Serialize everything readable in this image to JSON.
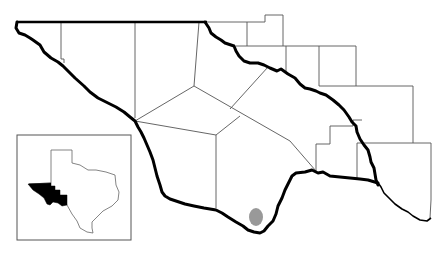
{
  "map": {
    "type": "regional-county-map",
    "description": "Regional map showing counties bounded by a thick river/boundary line, with an inset locator map of Texas and a gray oval marking a site",
    "colors": {
      "background": "#ffffff",
      "boundary_line": "#000000",
      "county_line": "#555555",
      "inset_highlight": "#000000",
      "site_marker": "#999999"
    },
    "inset": {
      "label": "Texas locator inset",
      "highlighted_region": "West Texas (Trans-Pecos)"
    },
    "site_marker": {
      "shape": "oval",
      "cx": 256,
      "cy": 217,
      "rx": 7,
      "ry": 9
    }
  }
}
